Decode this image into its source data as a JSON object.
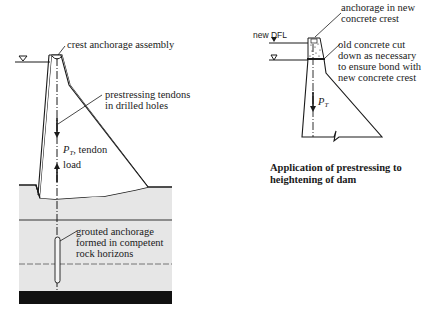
{
  "left_diagram": {
    "labels": {
      "crest": "crest anchorage assembly",
      "tendons_line1": "prestressing tendons",
      "tendons_line2": "in drilled holes",
      "load_symbol": "P",
      "load_subscript": "T",
      "load_text1": ", tendon",
      "load_text2": "load",
      "anchor_line1": "grouted anchorage",
      "anchor_line2": "formed in competent",
      "anchor_line3": "rock horizons"
    },
    "water_level_symbol": "▽"
  },
  "right_diagram": {
    "labels": {
      "new_dfl": "new DFL",
      "anchorage_line1": "anchorage in new",
      "anchorage_line2": "concrete crest",
      "old_line1": "old concrete cut",
      "old_line2": "down as necessary",
      "old_line3": "to ensure bond with",
      "old_line4": "new concrete crest",
      "load_symbol": "P",
      "load_subscript": "T"
    },
    "caption_line1": "Application of prestressing to",
    "caption_line2": "heightening of dam"
  },
  "colors": {
    "line": "#1a1a1a",
    "rock_fill": "#e6e6e6",
    "bedrock": "#111111"
  }
}
